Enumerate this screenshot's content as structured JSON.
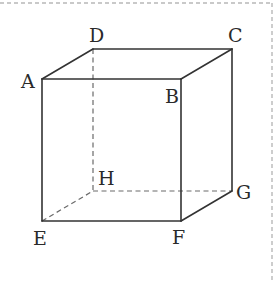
{
  "figure": {
    "type": "cube",
    "vertices": {
      "A": {
        "label": "A",
        "x": 42,
        "y": 79
      },
      "B": {
        "label": "B",
        "x": 181,
        "y": 79
      },
      "C": {
        "label": "C",
        "x": 232,
        "y": 49
      },
      "D": {
        "label": "D",
        "x": 93,
        "y": 49
      },
      "E": {
        "label": "E",
        "x": 42,
        "y": 221
      },
      "F": {
        "label": "F",
        "x": 181,
        "y": 221
      },
      "G": {
        "label": "G",
        "x": 232,
        "y": 191
      },
      "H": {
        "label": "H",
        "x": 93,
        "y": 191
      }
    },
    "solid_edges": [
      "AB",
      "BC",
      "CD",
      "DA",
      "AE",
      "BF",
      "CG",
      "EF",
      "FG"
    ],
    "hidden_edges": [
      "DH",
      "EH",
      "HG"
    ],
    "colors": {
      "edge": "#333333",
      "hidden_edge": "#6a6a6a",
      "frame": "#b8b8b8",
      "label": "#2a2a2a"
    }
  }
}
